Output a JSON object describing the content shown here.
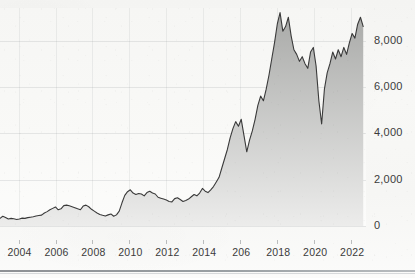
{
  "corner_note": "",
  "chart_data": {
    "type": "area",
    "title": "",
    "subtitle": "",
    "xlabel": "",
    "ylabel": "",
    "xlim": [
      2003.0,
      2022.8
    ],
    "ylim": [
      0,
      9400
    ],
    "grid": true,
    "legend": null,
    "legend_position": "none",
    "line_color": "#3a3a3a",
    "fill_top_color": "#a9aaa8",
    "fill_bottom_color": "#ececeb",
    "background_color": "#f7f7f5",
    "y_ticks": [
      0,
      2000,
      4000,
      6000,
      8000
    ],
    "y_tick_labels": [
      "0",
      "2,000",
      "4,000",
      "6,000",
      "8,000"
    ],
    "x_ticks": [
      2004,
      2006,
      2008,
      2010,
      2012,
      2014,
      2016,
      2018,
      2020,
      2022
    ],
    "x_tick_labels": [
      "2004",
      "2006",
      "2008",
      "2010",
      "2012",
      "2014",
      "206",
      "2018",
      "2020",
      "2022"
    ],
    "series": [
      {
        "name": "index-level",
        "x": [
          2003.0,
          2003.15,
          2003.3,
          2003.45,
          2003.6,
          2003.75,
          2003.9,
          2004.05,
          2004.2,
          2004.35,
          2004.5,
          2004.65,
          2004.8,
          2004.95,
          2005.1,
          2005.25,
          2005.4,
          2005.55,
          2005.7,
          2005.85,
          2006.0,
          2006.15,
          2006.3,
          2006.45,
          2006.6,
          2006.75,
          2006.9,
          2007.05,
          2007.2,
          2007.35,
          2007.5,
          2007.65,
          2007.8,
          2007.95,
          2008.1,
          2008.25,
          2008.4,
          2008.55,
          2008.7,
          2008.85,
          2009.0,
          2009.15,
          2009.3,
          2009.45,
          2009.6,
          2009.75,
          2009.9,
          2010.05,
          2010.2,
          2010.35,
          2010.5,
          2010.65,
          2010.8,
          2010.95,
          2011.1,
          2011.25,
          2011.4,
          2011.55,
          2011.7,
          2011.85,
          2012.0,
          2012.15,
          2012.3,
          2012.45,
          2012.6,
          2012.75,
          2012.9,
          2013.05,
          2013.2,
          2013.35,
          2013.5,
          2013.65,
          2013.8,
          2013.95,
          2014.1,
          2014.25,
          2014.4,
          2014.55,
          2014.7,
          2014.85,
          2015.0,
          2015.15,
          2015.3,
          2015.45,
          2015.6,
          2015.75,
          2015.9,
          2016.05,
          2016.2,
          2016.35,
          2016.5,
          2016.65,
          2016.8,
          2016.95,
          2017.1,
          2017.25,
          2017.4,
          2017.55,
          2017.7,
          2017.85,
          2018.0,
          2018.15,
          2018.3,
          2018.45,
          2018.6,
          2018.75,
          2018.9,
          2019.05,
          2019.2,
          2019.35,
          2019.5,
          2019.65,
          2019.8,
          2019.95,
          2020.1,
          2020.25,
          2020.4,
          2020.55,
          2020.7,
          2020.85,
          2021.0,
          2021.15,
          2021.3,
          2021.45,
          2021.6,
          2021.75,
          2021.9,
          2022.05,
          2022.2,
          2022.35,
          2022.5,
          2022.65
        ],
        "values": [
          330,
          420,
          370,
          300,
          330,
          310,
          280,
          300,
          340,
          330,
          360,
          380,
          400,
          430,
          450,
          470,
          560,
          620,
          700,
          760,
          820,
          700,
          740,
          880,
          900,
          870,
          830,
          790,
          740,
          700,
          860,
          900,
          830,
          720,
          640,
          560,
          500,
          460,
          430,
          480,
          520,
          420,
          480,
          640,
          1000,
          1320,
          1480,
          1560,
          1420,
          1360,
          1400,
          1380,
          1300,
          1440,
          1500,
          1420,
          1380,
          1240,
          1200,
          1160,
          1120,
          1060,
          1040,
          1180,
          1220,
          1140,
          1060,
          1100,
          1160,
          1260,
          1360,
          1300,
          1420,
          1620,
          1500,
          1440,
          1560,
          1700,
          1900,
          2100,
          2500,
          2900,
          3300,
          3800,
          4200,
          4500,
          4300,
          4600,
          3900,
          3200,
          3700,
          4100,
          4600,
          5200,
          5600,
          5400,
          5900,
          6500,
          7200,
          7900,
          8700,
          9200,
          8400,
          8600,
          9000,
          8200,
          7600,
          7400,
          7100,
          7300,
          7000,
          6800,
          7500,
          7700,
          6900,
          5400,
          4400,
          5900,
          6600,
          7000,
          7500,
          7200,
          7600,
          7300,
          7700,
          7400,
          7900,
          8300,
          8100,
          8700,
          9000,
          8600
        ]
      }
    ]
  }
}
